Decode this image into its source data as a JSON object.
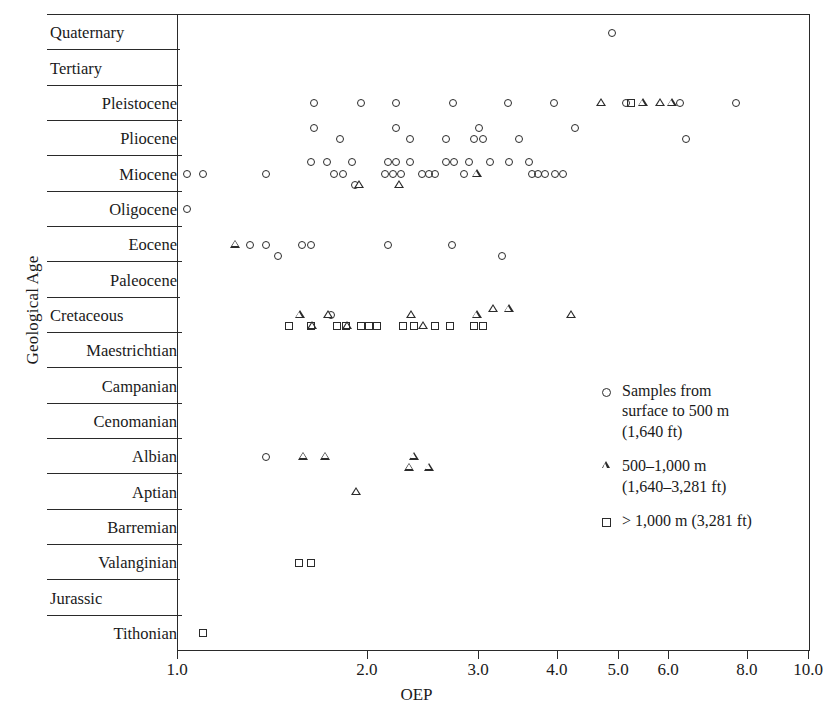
{
  "chart_data": {
    "type": "scatter",
    "title": "",
    "xlabel": "OEP",
    "ylabel": "Geological Age",
    "xscale": "log",
    "xlim": [
      1.0,
      10.0
    ],
    "xticks": [
      "1.0",
      "2.0",
      "3.0",
      "4.0",
      "5.0",
      "6.0",
      "8.0",
      "10.0"
    ],
    "xtick_values": [
      1.0,
      2.0,
      3.0,
      4.0,
      5.0,
      6.0,
      8.0,
      10.0
    ],
    "grid": false,
    "legend_position": "inside-right",
    "categories": [
      "Quaternary",
      "Tertiary",
      "Pleistocene",
      "Pliocene",
      "Miocene",
      "Oligocene",
      "Eocene",
      "Paleocene",
      "Cretaceous",
      "Maestrichtian",
      "Campanian",
      "Cenomanian",
      "Albian",
      "Aptian",
      "Barremian",
      "Valanginian",
      "Jurassic",
      "Tithonian"
    ],
    "series": [
      {
        "name": "Samples from surface to 500 m (1,640 ft)",
        "marker": "circle",
        "points": [
          {
            "age": "Quaternary",
            "oep": 4.8
          },
          {
            "age": "Pleistocene",
            "oep": 1.62
          },
          {
            "age": "Pleistocene",
            "oep": 1.92
          },
          {
            "age": "Pleistocene",
            "oep": 2.18
          },
          {
            "age": "Pleistocene",
            "oep": 2.69
          },
          {
            "age": "Pleistocene",
            "oep": 3.28
          },
          {
            "age": "Pleistocene",
            "oep": 3.88
          },
          {
            "age": "Pleistocene",
            "oep": 5.05
          },
          {
            "age": "Pleistocene",
            "oep": 6.15
          },
          {
            "age": "Pleistocene",
            "oep": 7.55
          },
          {
            "age": "Pliocene",
            "oep": 1.62
          },
          {
            "age": "Pliocene",
            "oep": 2.18
          },
          {
            "age": "Pliocene",
            "oep": 2.96
          },
          {
            "age": "Pliocene",
            "oep": 4.2
          },
          {
            "age": "Pliocene",
            "oep": 1.78
          },
          {
            "age": "Pliocene",
            "oep": 2.3
          },
          {
            "age": "Pliocene",
            "oep": 2.62
          },
          {
            "age": "Pliocene",
            "oep": 2.9
          },
          {
            "age": "Pliocene",
            "oep": 3.0
          },
          {
            "age": "Pliocene",
            "oep": 3.42
          },
          {
            "age": "Pliocene",
            "oep": 6.3
          },
          {
            "age": "Miocene",
            "oep": 1.6
          },
          {
            "age": "Miocene",
            "oep": 1.7
          },
          {
            "age": "Miocene",
            "oep": 1.86
          },
          {
            "age": "Miocene",
            "oep": 2.12
          },
          {
            "age": "Miocene",
            "oep": 2.18
          },
          {
            "age": "Miocene",
            "oep": 2.3
          },
          {
            "age": "Miocene",
            "oep": 2.62
          },
          {
            "age": "Miocene",
            "oep": 2.7
          },
          {
            "age": "Miocene",
            "oep": 2.85
          },
          {
            "age": "Miocene",
            "oep": 3.08
          },
          {
            "age": "Miocene",
            "oep": 3.3
          },
          {
            "age": "Miocene",
            "oep": 3.55
          },
          {
            "age": "Miocene",
            "oep": 1.02
          },
          {
            "age": "Miocene",
            "oep": 1.08
          },
          {
            "age": "Miocene",
            "oep": 1.36
          },
          {
            "age": "Miocene",
            "oep": 1.74
          },
          {
            "age": "Miocene",
            "oep": 1.8
          },
          {
            "age": "Miocene",
            "oep": 2.1
          },
          {
            "age": "Miocene",
            "oep": 2.16
          },
          {
            "age": "Miocene",
            "oep": 2.22
          },
          {
            "age": "Miocene",
            "oep": 2.4
          },
          {
            "age": "Miocene",
            "oep": 2.46
          },
          {
            "age": "Miocene",
            "oep": 2.52
          },
          {
            "age": "Miocene",
            "oep": 2.8
          },
          {
            "age": "Miocene",
            "oep": 3.58
          },
          {
            "age": "Miocene",
            "oep": 3.66
          },
          {
            "age": "Miocene",
            "oep": 3.76
          },
          {
            "age": "Miocene",
            "oep": 3.9
          },
          {
            "age": "Miocene",
            "oep": 4.02
          },
          {
            "age": "Miocene",
            "oep": 1.88
          },
          {
            "age": "Oligocene",
            "oep": 1.02
          },
          {
            "age": "Eocene",
            "oep": 1.28
          },
          {
            "age": "Eocene",
            "oep": 1.36
          },
          {
            "age": "Eocene",
            "oep": 1.55
          },
          {
            "age": "Eocene",
            "oep": 1.6
          },
          {
            "age": "Eocene",
            "oep": 2.12
          },
          {
            "age": "Eocene",
            "oep": 2.68
          },
          {
            "age": "Eocene",
            "oep": 1.42
          },
          {
            "age": "Eocene",
            "oep": 3.22
          },
          {
            "age": "Cretaceous",
            "oep": 1.72
          },
          {
            "age": "Albian",
            "oep": 1.36
          }
        ]
      },
      {
        "name": "500–1,000 m (1,640–3,281 ft)",
        "marker": "triangle",
        "points": [
          {
            "age": "Pleistocene",
            "oep": 4.6
          },
          {
            "age": "Pleistocene",
            "oep": 5.35
          },
          {
            "age": "Pleistocene",
            "oep": 5.7
          },
          {
            "age": "Pleistocene",
            "oep": 5.95
          },
          {
            "age": "Miocene",
            "oep": 2.92
          },
          {
            "age": "Miocene",
            "oep": 1.9
          },
          {
            "age": "Miocene",
            "oep": 2.2
          },
          {
            "age": "Eocene",
            "oep": 1.21
          },
          {
            "age": "Cretaceous",
            "oep": 1.53
          },
          {
            "age": "Cretaceous",
            "oep": 1.7
          },
          {
            "age": "Cretaceous",
            "oep": 2.3
          },
          {
            "age": "Cretaceous",
            "oep": 2.92
          },
          {
            "age": "Cretaceous",
            "oep": 3.1
          },
          {
            "age": "Cretaceous",
            "oep": 3.28
          },
          {
            "age": "Cretaceous",
            "oep": 4.12
          },
          {
            "age": "Cretaceous",
            "oep": 1.6
          },
          {
            "age": "Cretaceous",
            "oep": 1.82
          },
          {
            "age": "Cretaceous",
            "oep": 2.4
          },
          {
            "age": "Albian",
            "oep": 1.55
          },
          {
            "age": "Albian",
            "oep": 1.68
          },
          {
            "age": "Albian",
            "oep": 2.32
          },
          {
            "age": "Albian",
            "oep": 2.28
          },
          {
            "age": "Albian",
            "oep": 2.45
          },
          {
            "age": "Aptian",
            "oep": 1.88
          }
        ]
      },
      {
        "name": "> 1,000 m (3,281 ft)",
        "marker": "square",
        "points": [
          {
            "age": "Pleistocene",
            "oep": 5.15
          },
          {
            "age": "Cretaceous",
            "oep": 1.48
          },
          {
            "age": "Cretaceous",
            "oep": 1.6
          },
          {
            "age": "Cretaceous",
            "oep": 1.76
          },
          {
            "age": "Cretaceous",
            "oep": 1.82
          },
          {
            "age": "Cretaceous",
            "oep": 1.92
          },
          {
            "age": "Cretaceous",
            "oep": 1.98
          },
          {
            "age": "Cretaceous",
            "oep": 2.04
          },
          {
            "age": "Cretaceous",
            "oep": 2.24
          },
          {
            "age": "Cretaceous",
            "oep": 2.33
          },
          {
            "age": "Cretaceous",
            "oep": 2.52
          },
          {
            "age": "Cretaceous",
            "oep": 2.66
          },
          {
            "age": "Cretaceous",
            "oep": 2.9
          },
          {
            "age": "Cretaceous",
            "oep": 3.0
          },
          {
            "age": "Valanginian",
            "oep": 1.53
          },
          {
            "age": "Valanginian",
            "oep": 1.6
          },
          {
            "age": "Tithonian",
            "oep": 1.08
          }
        ]
      }
    ]
  },
  "axis": {
    "y_caption": "Geological Age",
    "x_caption": "OEP"
  },
  "legend": {
    "items": [
      {
        "marker": "circle",
        "lines": [
          "Samples from",
          "surface to 500 m",
          "(1,640 ft)"
        ]
      },
      {
        "marker": "triangle",
        "lines": [
          "500–1,000 m",
          "(1,640–3,281 ft)"
        ]
      },
      {
        "marker": "square",
        "lines": [
          "> 1,000 m (3,281 ft)"
        ]
      }
    ]
  },
  "style": {
    "ink": "#2b2b2b",
    "background": "#ffffff"
  }
}
